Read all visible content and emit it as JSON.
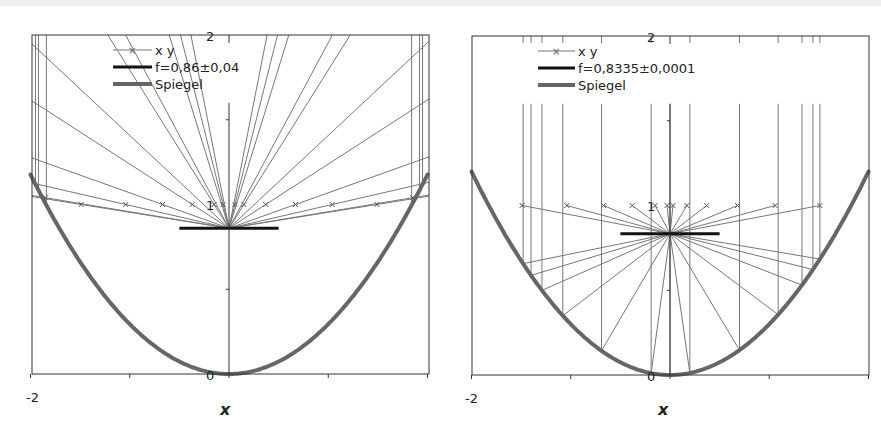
{
  "chart_data": [
    {
      "type": "line",
      "title": "",
      "xlabel": "x",
      "ylabel": "",
      "xlim": [
        -2,
        2
      ],
      "ylim": [
        0,
        2
      ],
      "x_tick_labels": [
        "-2"
      ],
      "y_tick_labels": [
        "0",
        "1",
        "2"
      ],
      "grid": false,
      "legend_position": "upper-left",
      "legend": [
        "x y",
        "f=0,86±0,04",
        "Spiegel"
      ],
      "focus_y": 0.86,
      "focus_halfwidth": 0.5,
      "mirror_f": 0.85,
      "marker_y": 1.0,
      "marker_x": [
        -1.85,
        -1.49,
        -1.04,
        -0.67,
        -0.37,
        -0.15,
        -0.06,
        0.06,
        0.15,
        0.37,
        0.67,
        1.04,
        1.49,
        1.85
      ],
      "vertical_x": [
        -1.95,
        -1.92,
        -1.84,
        1.84,
        1.92,
        1.95
      ],
      "series": [
        {
          "name": "x y",
          "style": "thin line with x markers"
        },
        {
          "name": "f=0,86±0,04",
          "style": "thick black"
        },
        {
          "name": "Spiegel",
          "style": "thick gray",
          "function": "y = x^2/(4f)"
        }
      ]
    },
    {
      "type": "line",
      "title": "",
      "xlabel": "x",
      "ylabel": "",
      "xlim": [
        -2,
        2
      ],
      "ylim": [
        0,
        2
      ],
      "x_tick_labels": [
        "-2"
      ],
      "y_tick_labels": [
        "0",
        "1",
        "2"
      ],
      "grid": false,
      "legend_position": "upper-left",
      "legend": [
        "x y",
        "f=0,8335±0,0001",
        "Spiegel"
      ],
      "focus_y": 0.8335,
      "focus_halfwidth": 0.5,
      "mirror_f": 0.8335,
      "marker_y": 1.0,
      "marker_x": [
        -1.49,
        -1.04,
        -0.67,
        -0.38,
        -0.15,
        -0.03,
        0.03,
        0.17,
        0.37,
        0.68,
        1.06,
        1.51
      ],
      "vertical_x": [
        -1.48,
        -1.4,
        -1.29,
        -1.08,
        -0.69,
        -0.19,
        0.2,
        0.7,
        1.09,
        1.33,
        1.44,
        1.51
      ],
      "series": [
        {
          "name": "x y",
          "style": "thin line with x markers"
        },
        {
          "name": "f=0,8335±0,0001",
          "style": "thick black"
        },
        {
          "name": "Spiegel",
          "style": "thick gray",
          "function": "y = x^2/(4f)"
        }
      ]
    }
  ]
}
